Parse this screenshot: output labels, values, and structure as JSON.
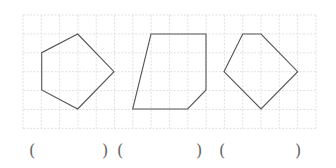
{
  "grid": {
    "x0": 23,
    "y0": 15,
    "cols": 16,
    "rows": 6,
    "cell_w": 18.31,
    "cell_h": 18.9,
    "line_color": "#d9d9d9"
  },
  "shapes": [
    {
      "name": "pentagon",
      "stroke": "#555555",
      "points": [
        [
          77.7,
          34
        ],
        [
          114,
          71.7
        ],
        [
          77.7,
          109
        ],
        [
          41.7,
          90
        ],
        [
          41.7,
          52.7
        ]
      ]
    },
    {
      "name": "pentagon-irregular",
      "stroke": "#555555",
      "points": [
        [
          151,
          34
        ],
        [
          206,
          34
        ],
        [
          206,
          90
        ],
        [
          187.7,
          109
        ],
        [
          132.7,
          109
        ]
      ]
    },
    {
      "name": "pentagon-kite",
      "stroke": "#555555",
      "points": [
        [
          242.7,
          34
        ],
        [
          261,
          34
        ],
        [
          297.7,
          71.7
        ],
        [
          261,
          109
        ],
        [
          224,
          71.7
        ]
      ]
    }
  ],
  "answers": [
    {
      "open": "(",
      "close": ")",
      "open_x": 29,
      "close_x": 102,
      "value": ""
    },
    {
      "open": "(",
      "close": ")",
      "open_x": 117,
      "close_x": 196,
      "value": ""
    },
    {
      "open": "(",
      "close": ")",
      "open_x": 219,
      "close_x": 295,
      "value": ""
    }
  ]
}
